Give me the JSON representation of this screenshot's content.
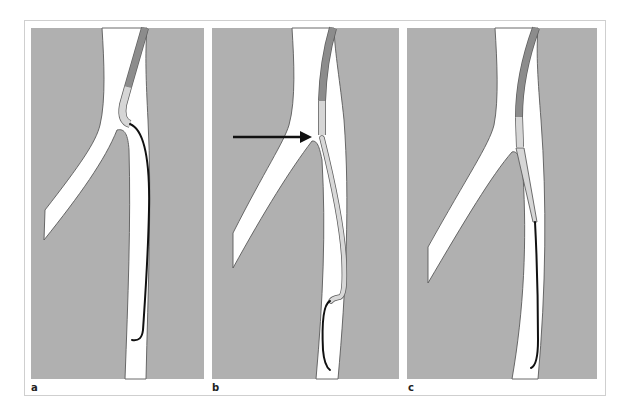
{
  "figure": {
    "panels": [
      {
        "id": "a",
        "label": "a",
        "description": "Catheter tip angled into branch ostium; guidewire advanced distally in main vessel forming a long loop"
      },
      {
        "id": "b",
        "label": "b",
        "description": "Arrow points to catheter tip at branch junction; light sheath advanced over wire down the main vessel; wire tip curled distally"
      },
      {
        "id": "c",
        "label": "c",
        "description": "Catheter and tapered light sheath aligned in main vessel below junction; wire extends distally"
      }
    ],
    "annotation": {
      "arrow": "right-pointing-arrow",
      "panel": "b"
    },
    "colors": {
      "tissue": "#b0b0b0",
      "vessel_lumen": "#ffffff",
      "catheter_shaft": "#8c8c8c",
      "catheter_tip": "#d6d6d6",
      "guidewire": "#111111",
      "frame": "#cfcfcf"
    }
  }
}
